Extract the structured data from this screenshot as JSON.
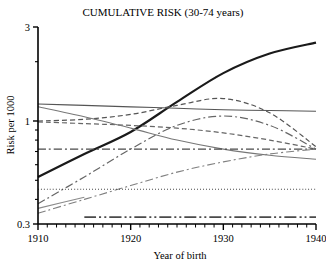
{
  "chart_data": {
    "type": "line",
    "title": "CUMULATIVE RISK (30-74 years)",
    "xlabel": "Year of birth",
    "ylabel": "Risk per 1000",
    "xlim": [
      1910,
      1940
    ],
    "ylim": [
      0.3,
      3
    ],
    "yscale": "log",
    "grid": false,
    "legend": "none",
    "xticks": [
      1910,
      1920,
      1930,
      1940
    ],
    "xtick_labels": [
      "1910",
      "1920",
      "1930",
      "1940"
    ],
    "xminor_step": 1,
    "yticks": [
      0.3,
      1,
      3
    ],
    "ytick_labels": [
      "0.3",
      "1",
      "3"
    ],
    "yminor_ticks": [
      0.4,
      0.5,
      0.6,
      0.7,
      0.8,
      0.9,
      2
    ],
    "x": [
      1910,
      1915,
      1920,
      1925,
      1930,
      1935,
      1940
    ],
    "series": [
      {
        "name": "rising-thick-solid",
        "style": "solid",
        "width": 2.2,
        "color": "#1a1a1a",
        "values": [
          0.52,
          0.68,
          0.88,
          1.25,
          1.75,
          2.2,
          2.5
        ]
      },
      {
        "name": "flat-high-solid",
        "style": "solid",
        "width": 1.1,
        "color": "#555555",
        "values": [
          1.22,
          1.2,
          1.18,
          1.16,
          1.14,
          1.13,
          1.12
        ]
      },
      {
        "name": "arch-dashed-upper",
        "style": "dashed",
        "width": 1.2,
        "color": "#555555",
        "values": [
          1.0,
          1.02,
          1.08,
          1.2,
          1.3,
          1.1,
          0.74
        ]
      },
      {
        "name": "declining-dashed-mid",
        "style": "dashed",
        "width": 1.2,
        "color": "#666666",
        "values": [
          0.99,
          0.97,
          0.95,
          0.92,
          0.87,
          0.8,
          0.72
        ]
      },
      {
        "name": "descending-solid-gray",
        "style": "solid",
        "width": 1.1,
        "color": "#777777",
        "values": [
          1.18,
          1.05,
          0.92,
          0.8,
          0.72,
          0.67,
          0.64
        ]
      },
      {
        "name": "flat-dashdot-mid",
        "style": "dashdot",
        "width": 1.4,
        "color": "#4a4a4a",
        "values": [
          0.72,
          0.72,
          0.72,
          0.72,
          0.72,
          0.72,
          0.72
        ]
      },
      {
        "name": "hump-dashdot-rising",
        "style": "dashdot",
        "width": 1.2,
        "color": "#666666",
        "values": [
          0.38,
          0.52,
          0.72,
          0.95,
          1.06,
          0.95,
          0.72
        ]
      },
      {
        "name": "low-rising-dashdot",
        "style": "dashdot",
        "width": 1.1,
        "color": "#808080",
        "values": [
          0.34,
          0.4,
          0.47,
          0.55,
          0.62,
          0.68,
          0.72
        ]
      },
      {
        "name": "dotted-flat-low",
        "style": "dotted",
        "width": 1.1,
        "color": "#4a4a4a",
        "values": [
          0.45,
          0.45,
          0.45,
          0.45,
          0.45,
          0.45,
          0.45
        ]
      },
      {
        "name": "longdash-dotdot-bottom",
        "style": "longdashdotdot",
        "width": 1.6,
        "color": "#4a4a4a",
        "values": [
          null,
          0.325,
          0.325,
          0.325,
          0.325,
          0.325,
          0.325
        ]
      },
      {
        "name": "short-solid-lower-left",
        "style": "solid",
        "width": 1.1,
        "color": "#8a8a8a",
        "values": [
          0.36,
          0.41,
          null,
          null,
          null,
          null,
          null
        ]
      }
    ]
  }
}
